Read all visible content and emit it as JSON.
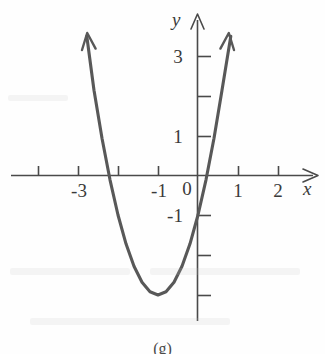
{
  "figure": {
    "caption": "(g)",
    "background_color": "#fefefe",
    "ink_color": "#4a4a4a",
    "curve_color": "#585858"
  },
  "axes": {
    "x_axis_label": "x",
    "y_axis_label": "y",
    "origin_label": "0"
  },
  "chart_data": {
    "type": "line",
    "title": "",
    "subtitle": "",
    "xlabel": "x",
    "ylabel": "y",
    "grid": false,
    "legend": "none",
    "xlim": [
      -4.7,
      2.9
    ],
    "ylim": [
      -3.6,
      4.0
    ],
    "x_ticks": [
      -4,
      -3,
      -2,
      -1,
      1,
      2
    ],
    "x_tick_labels": [
      "",
      "-3",
      "",
      "-1",
      "1",
      "2"
    ],
    "y_ticks": [
      3,
      2,
      1,
      -1,
      -2,
      -3
    ],
    "y_tick_labels": [
      "3",
      "",
      "1",
      "-1",
      "",
      ""
    ],
    "annotations": [
      {
        "text": "0",
        "x": -0.28,
        "y": -0.45,
        "role": "origin-label"
      },
      {
        "text": "x",
        "x": 2.8,
        "y": -0.35,
        "role": "x-axis-label"
      },
      {
        "text": "y",
        "x": -0.45,
        "y": 3.85,
        "role": "y-axis-label"
      }
    ],
    "series": [
      {
        "name": "parabola",
        "equation": "y = 2(x + 1)^2 - 3",
        "vertex": [
          -1,
          -3.07
        ],
        "y_intercept": [
          0,
          -1.05
        ],
        "x_intercepts": [
          -2.23,
          0.23
        ],
        "arrow_ends": [
          [
            -2.78,
            3.47
          ],
          [
            0.82,
            3.47
          ]
        ],
        "x": [
          -2.78,
          -2.6,
          -2.4,
          -2.2,
          -2.0,
          -1.8,
          -1.6,
          -1.4,
          -1.2,
          -1.0,
          -0.8,
          -0.6,
          -0.4,
          -0.2,
          0.0,
          0.2,
          0.4,
          0.6,
          0.82
        ],
        "y": [
          3.47,
          2.12,
          0.92,
          -0.12,
          -1.0,
          -1.72,
          -2.28,
          -2.68,
          -2.92,
          -3.0,
          -2.92,
          -2.68,
          -2.28,
          -1.72,
          -1.0,
          -0.12,
          0.92,
          2.12,
          3.47
        ]
      }
    ]
  },
  "tick_labels": {
    "x_minus3": "-3",
    "x_minus1": "-1",
    "x_one": "1",
    "x_two": "2",
    "y_three": "3",
    "y_one": "1",
    "y_minus1": "-1",
    "origin": "0"
  }
}
